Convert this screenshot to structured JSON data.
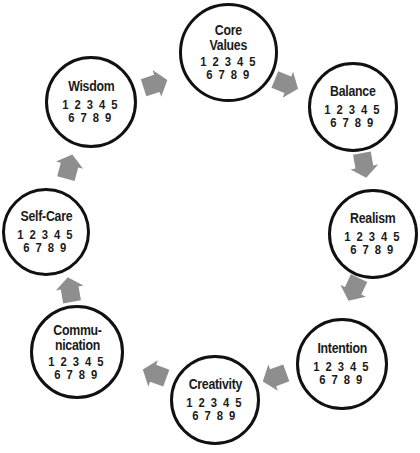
{
  "diagram": {
    "type": "cycle",
    "arrow_color": "#8e8e8e",
    "circle_border_color": "#111111",
    "nodes": [
      {
        "id": "core-values",
        "title": "Core\nValues",
        "scale_row1": "1 2 3 4 5",
        "scale_row2": "6 7 8 9"
      },
      {
        "id": "balance",
        "title": "Balance",
        "scale_row1": "1 2 3 4 5",
        "scale_row2": "6 7 8 9"
      },
      {
        "id": "realism",
        "title": "Realism",
        "scale_row1": "1 2 3 4 5",
        "scale_row2": "6 7 8 9"
      },
      {
        "id": "intention",
        "title": "Intention",
        "scale_row1": "1 2 3 4 5",
        "scale_row2": "6 7 8 9"
      },
      {
        "id": "creativity",
        "title": "Creativity",
        "scale_row1": "1 2 3 4 5",
        "scale_row2": "6 7 8 9"
      },
      {
        "id": "communication",
        "title": "Commu-\nnication",
        "scale_row1": "1 2 3 4 5",
        "scale_row2": "6 7 8 9"
      },
      {
        "id": "self-care",
        "title": "Self-Care",
        "scale_row1": "1 2 3 4 5",
        "scale_row2": "6 7 8 9"
      },
      {
        "id": "wisdom",
        "title": "Wisdom",
        "scale_row1": "1 2 3 4 5",
        "scale_row2": "6 7 8 9"
      }
    ],
    "edges": [
      {
        "from": "wisdom",
        "to": "core-values"
      },
      {
        "from": "core-values",
        "to": "balance"
      },
      {
        "from": "balance",
        "to": "realism"
      },
      {
        "from": "realism",
        "to": "intention"
      },
      {
        "from": "intention",
        "to": "creativity"
      },
      {
        "from": "creativity",
        "to": "communication"
      },
      {
        "from": "communication",
        "to": "self-care"
      },
      {
        "from": "self-care",
        "to": "wisdom"
      }
    ]
  }
}
